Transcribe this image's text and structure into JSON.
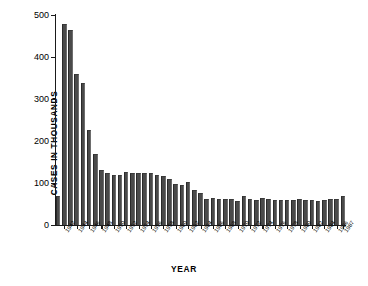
{
  "chart_data": {
    "type": "bar",
    "title": "",
    "xlabel": "YEAR",
    "ylabel": "CASES IN THOUSANDS",
    "ylim": [
      0,
      500
    ],
    "yticks": [
      0,
      100,
      200,
      300,
      400,
      500
    ],
    "ytick_labels": [
      "0",
      "100",
      "200",
      "300",
      "400",
      "500"
    ],
    "grid": false,
    "legend": null,
    "bar_color": "#4a4a4a",
    "categories": [
      "1941",
      "1942",
      "1943",
      "1944",
      "1945",
      "1946",
      "1947",
      "1948",
      "1949",
      "1950",
      "1951",
      "1952",
      "1953",
      "1954",
      "1955",
      "1956",
      "1957",
      "1958",
      "1959",
      "1960",
      "1961",
      "1962",
      "1963",
      "1964",
      "1965",
      "1966",
      "1967",
      "1968",
      "1969",
      "1970",
      "1971",
      "1972",
      "1973",
      "1974",
      "1975",
      "1976",
      "1977",
      "1978",
      "1979",
      "1980",
      "1981",
      "1982",
      "1983",
      "1984",
      "1985",
      "1986",
      "1987"
    ],
    "values": [
      70,
      478,
      465,
      360,
      337,
      227,
      168,
      131,
      123,
      120,
      118,
      126,
      123,
      124,
      125,
      123,
      119,
      116,
      110,
      97,
      96,
      102,
      83,
      77,
      63,
      64,
      63,
      62,
      62,
      56,
      68,
      62,
      59,
      64,
      63,
      59,
      60,
      59,
      60,
      62,
      60,
      60,
      57,
      60,
      62,
      63,
      70
    ],
    "xtick_labels": [
      "1942",
      "1944",
      "1946",
      "1948",
      "1950",
      "1952",
      "1954",
      "1956",
      "1958",
      "1960",
      "1962",
      "1964",
      "1966",
      "1968",
      "1970",
      "1972",
      "1974",
      "1976",
      "1978",
      "1980",
      "1982",
      "1984",
      "1986",
      "1987"
    ],
    "xtick_indices": [
      1,
      3,
      5,
      7,
      9,
      11,
      13,
      15,
      17,
      19,
      21,
      23,
      25,
      27,
      29,
      31,
      33,
      35,
      37,
      39,
      41,
      43,
      45,
      46
    ]
  }
}
